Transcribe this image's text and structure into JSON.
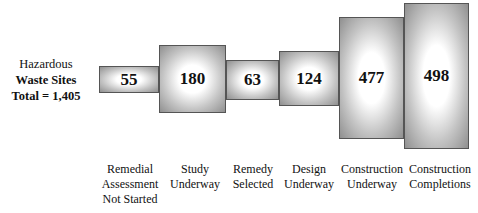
{
  "title_block": {
    "line1": "Hazardous",
    "line2": "Waste Sites",
    "line3": "Total = 1,405"
  },
  "colors": {
    "box_edge": "#8a8a8a",
    "box_center": "#ffffff",
    "border": "#555555"
  },
  "chart_data": {
    "type": "bar",
    "title": "Hazardous Waste Sites Total = 1,405",
    "categories": [
      "Remedial Assessment Not Started",
      "Study Underway",
      "Remedy Selected",
      "Design Underway",
      "Construction Underway",
      "Construction Completions"
    ],
    "values": [
      55,
      180,
      63,
      124,
      477,
      498
    ],
    "total": 1405
  },
  "stages": [
    {
      "value": "55",
      "label": "Remedial\nAssessment\nNot Started"
    },
    {
      "value": "180",
      "label": "Study\nUnderway"
    },
    {
      "value": "63",
      "label": "Remedy\nSelected"
    },
    {
      "value": "124",
      "label": "Design\nUnderway"
    },
    {
      "value": "477",
      "label": "Construction\nUnderway"
    },
    {
      "value": "498",
      "label": "Construction\nCompletions"
    }
  ]
}
